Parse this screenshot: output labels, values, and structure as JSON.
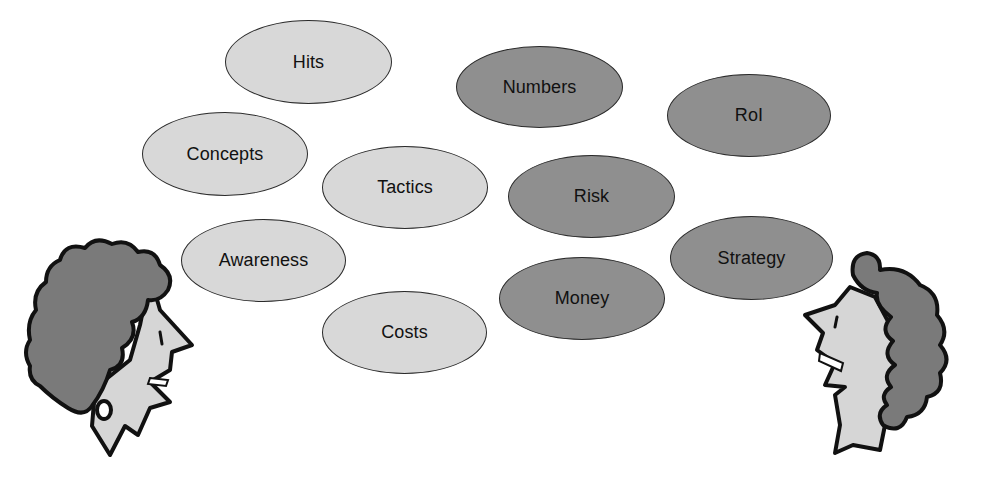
{
  "colors": {
    "light_fill": "#d8d8d8",
    "dark_fill": "#8f8f8f",
    "outline": "#2a2a2a",
    "hair": "#7a7a7a",
    "skin": "#d6d6d6"
  },
  "bubbles": {
    "hits": {
      "label": "Hits",
      "tone": "light",
      "x": 225,
      "y": 20,
      "w": 167,
      "h": 84
    },
    "concepts": {
      "label": "Concepts",
      "tone": "light",
      "x": 142,
      "y": 112,
      "w": 166,
      "h": 84
    },
    "tactics": {
      "label": "Tactics",
      "tone": "light",
      "x": 322,
      "y": 146,
      "w": 166,
      "h": 83
    },
    "awareness": {
      "label": "Awareness",
      "tone": "light",
      "x": 181,
      "y": 219,
      "w": 165,
      "h": 83
    },
    "costs": {
      "label": "Costs",
      "tone": "light",
      "x": 322,
      "y": 291,
      "w": 165,
      "h": 83
    },
    "numbers": {
      "label": "Numbers",
      "tone": "dark",
      "x": 456,
      "y": 46,
      "w": 167,
      "h": 82
    },
    "roi": {
      "label": "RoI",
      "tone": "dark",
      "x": 667,
      "y": 74,
      "w": 164,
      "h": 83
    },
    "risk": {
      "label": "Risk",
      "tone": "dark",
      "x": 508,
      "y": 155,
      "w": 167,
      "h": 83
    },
    "strategy": {
      "label": "Strategy",
      "tone": "dark",
      "x": 670,
      "y": 216,
      "w": 163,
      "h": 84
    },
    "money": {
      "label": "Money",
      "tone": "dark",
      "x": 499,
      "y": 257,
      "w": 166,
      "h": 83
    }
  },
  "figures": {
    "left": {
      "description": "cartoon woman facing right, curly hair, earring, smiling"
    },
    "right": {
      "description": "cartoon woman facing left, curly hair, smiling"
    }
  }
}
